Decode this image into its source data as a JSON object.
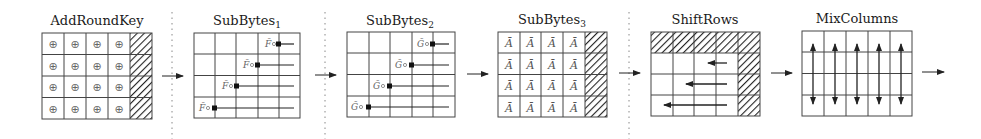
{
  "stages": [
    {
      "id": "addroundkey",
      "title": "AddRoundKey",
      "subscript": "",
      "cell_symbol": "⊕"
    },
    {
      "id": "subbytes1",
      "title": "SubBytes",
      "subscript": "1",
      "row_label": "F̄"
    },
    {
      "id": "subbytes2",
      "title": "SubBytes",
      "subscript": "2",
      "row_label": "G̃"
    },
    {
      "id": "subbytes3",
      "title": "SubBytes",
      "subscript": "3",
      "cell_symbol": "Ā"
    },
    {
      "id": "shiftrows",
      "title": "ShiftRows",
      "subscript": ""
    },
    {
      "id": "mixcolumns",
      "title": "MixColumns",
      "subscript": ""
    }
  ],
  "colors": {
    "line": "#333333",
    "grid": "#444444",
    "separator": "#888888",
    "label": "#666666"
  }
}
